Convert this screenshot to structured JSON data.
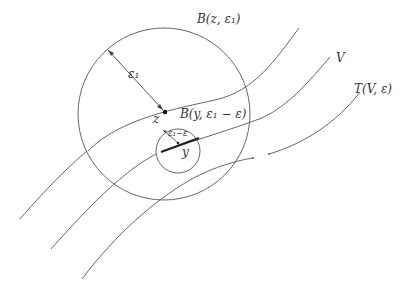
{
  "figure": {
    "colors": {
      "background": "#ffffff",
      "stroke": "#555555",
      "bold_segment": "#222222",
      "text": "#333333"
    }
  },
  "labels": {
    "big_ball": "B(z, ε₁)",
    "small_ball": "B(y, ε₁ − ε)",
    "big_radius": "ε₁",
    "small_radius": "ε₁−ε",
    "point_z": "z",
    "point_y": "y",
    "curve_v": "V",
    "tube": "T(V, ε)"
  },
  "geometry": {
    "big_circle": {
      "cx": 164,
      "cy": 114,
      "r": 86
    },
    "small_circle": {
      "cx": 178,
      "cy": 151,
      "r": 22
    },
    "point_z": {
      "x": 164,
      "y": 112
    },
    "point_y": {
      "x": 178,
      "y": 143
    }
  }
}
